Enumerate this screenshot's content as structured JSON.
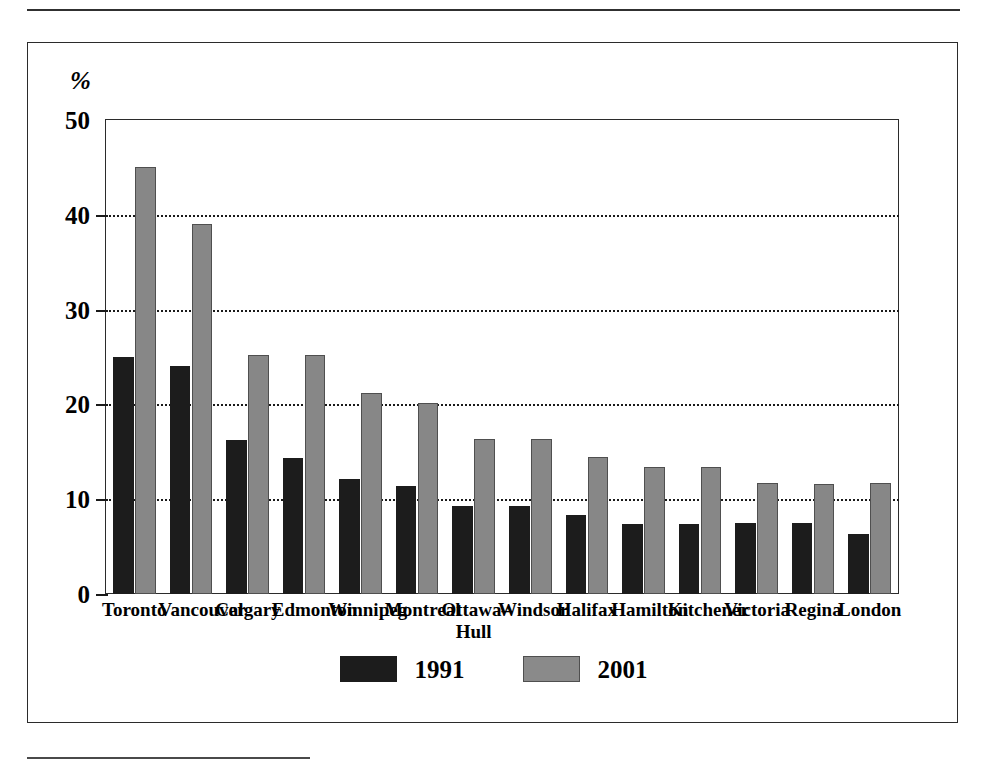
{
  "chart_data": {
    "type": "bar",
    "title": "",
    "subtitle": "",
    "xlabel": "",
    "ylabel": "%",
    "ylim": [
      0,
      50
    ],
    "yticks": [
      0,
      10,
      20,
      30,
      40,
      50
    ],
    "ytick_labels": [
      "0",
      "10",
      "20",
      "30",
      "40",
      "50"
    ],
    "grid": "horizontal-dotted",
    "legend_position": "bottom-center",
    "categories": [
      "Toronto",
      "Vancouver",
      "Calgary",
      "Edmonton",
      "Winnipeg",
      "Montreal",
      "Ottawa–\nHull",
      "Windsor",
      "Halifax",
      "Hamilton",
      "Kitchener",
      "Victoria",
      "Regina",
      "London"
    ],
    "series": [
      {
        "name": "1991",
        "color": "#1c1c1c",
        "values": [
          25.0,
          24.1,
          16.2,
          14.4,
          12.1,
          11.4,
          9.3,
          9.3,
          8.3,
          7.4,
          7.4,
          7.5,
          7.5,
          6.3
        ]
      },
      {
        "name": "2001",
        "color": "#878787",
        "values": [
          45.0,
          39.0,
          25.2,
          25.2,
          21.2,
          20.2,
          16.3,
          16.3,
          14.5,
          13.4,
          13.4,
          11.7,
          11.6,
          11.7
        ]
      }
    ]
  },
  "legend": {
    "items": [
      {
        "label": "1991",
        "series": "s1991"
      },
      {
        "label": "2001",
        "series": "s2001"
      }
    ]
  },
  "axis": {
    "unit_symbol": "%"
  }
}
